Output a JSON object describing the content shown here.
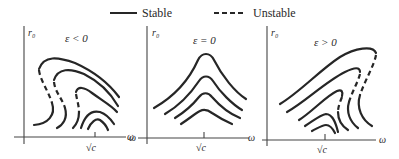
{
  "legend": {
    "stable_label": "Stable",
    "unstable_label": "Unstable"
  },
  "panels": [
    {
      "title": "ε < 0",
      "y_axis_label": "r₀",
      "x_axis_label": "ω",
      "tick_label": "√c"
    },
    {
      "title": "ε = 0",
      "y_axis_label": "r₀",
      "x_axis_label": "ω",
      "tick_label": "√c"
    },
    {
      "title": "ε > 0",
      "y_axis_label": "r₀",
      "x_axis_label": "ω",
      "tick_label": "√c"
    }
  ],
  "colors": {
    "ink": "#262626",
    "background": "#ffffff"
  }
}
